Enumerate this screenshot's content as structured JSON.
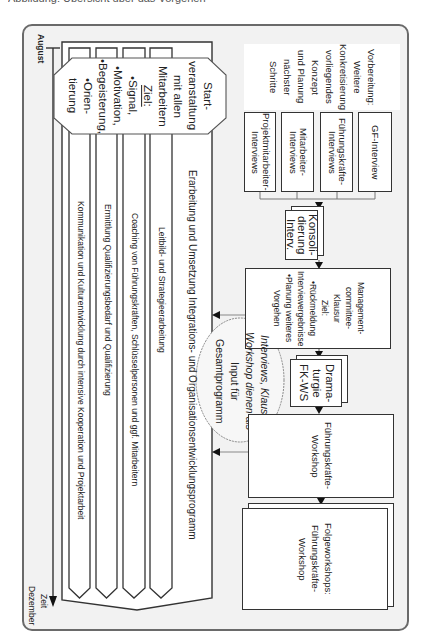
{
  "caption": "Abbildung: Übersicht über das Vorgehen",
  "timeline": {
    "start_label": "August",
    "end_label_1": "Zeit",
    "end_label_2": "Dezember"
  },
  "program_arrow": {
    "title": "Erarbeitung und Umsetzung Integrations- und Organisationsentwicklungsprogramm",
    "streams": [
      "Leitbild- und Strategieerarbeitung",
      "Coaching von Führungskräften, Schlüsselpersonen und ggf. Mitarbeitern",
      "Ermittlung Qualifizierungsbedarf und Qualifizierung",
      "Kommunikation und Kulturentwicklung durch intensive Kooperation und Projektarbeit"
    ]
  },
  "kickoff": {
    "title_lines": [
      "Start-",
      "veranstaltung",
      "mit allen",
      "Mitarbeitern"
    ],
    "goal_label": "Ziel:",
    "goals": [
      "•Signal,",
      "•Motivation,",
      "•Begeisterung,",
      "•Orien-",
      "tierung"
    ]
  },
  "preparation": {
    "lines": [
      "Vorbereitung:",
      "Weitere",
      "Konkretisierung",
      "vorliegendes",
      "Konzept",
      "und Planung",
      "nächster",
      "Schritte"
    ]
  },
  "interviews": [
    {
      "label": "GF-Interview"
    },
    {
      "label": "Führungskräfte-Interviews"
    },
    {
      "label": "Mitarbeiter-Interviews"
    },
    {
      "label": "Projektmitarbeiter-Interviews"
    }
  ],
  "consolidation": {
    "lines": [
      "Konsoli-",
      "dierung",
      "Interv."
    ]
  },
  "management_retreat": {
    "lines": [
      "Management-",
      "committee-",
      "Klausur",
      "Ziel:",
      "•Rückmeldung",
      "Interviewergebnisse",
      "•Planung weiteres",
      "Vorgehen"
    ]
  },
  "input_note": {
    "lines": [
      "Interviews, Klausur,",
      "Workshop dienen als",
      "Input für",
      "Gesamtprogramm"
    ]
  },
  "dramaturgy": {
    "lines": [
      "Drama-",
      "turgie",
      "FK-WS"
    ]
  },
  "leadership_workshop": {
    "lines": [
      "Führungskräfte-",
      "Workshop"
    ]
  },
  "followup_workshops": {
    "lines": [
      "Folgeworkshops:",
      "Führungskräfte-",
      "Workshop"
    ]
  },
  "colors": {
    "frame_bg": "#f2f2f2",
    "frame_border": "#6a6a6a",
    "box_border": "#333333",
    "box_bg": "#ffffff"
  }
}
